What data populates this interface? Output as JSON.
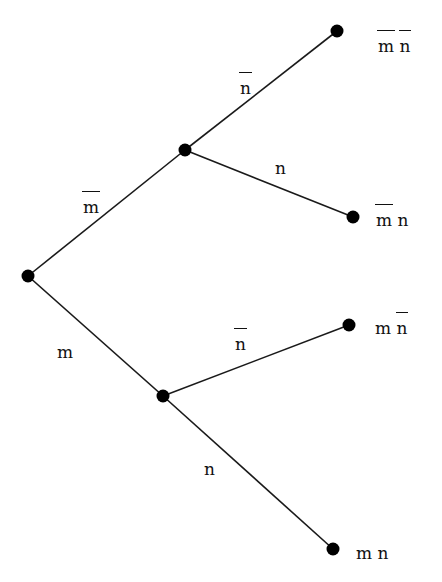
{
  "diagram": {
    "type": "probability-tree",
    "nodes": [
      {
        "id": "root",
        "x": 28,
        "y": 276
      },
      {
        "id": "not_m",
        "x": 185,
        "y": 150
      },
      {
        "id": "m",
        "x": 163,
        "y": 396
      },
      {
        "id": "not_m_not_n",
        "x": 337,
        "y": 31
      },
      {
        "id": "not_m_n",
        "x": 353,
        "y": 217
      },
      {
        "id": "m_not_n",
        "x": 349,
        "y": 325
      },
      {
        "id": "m_n",
        "x": 333,
        "y": 549
      }
    ],
    "edges": [
      {
        "from": "root",
        "to": "not_m",
        "label": "m",
        "barred": true
      },
      {
        "from": "root",
        "to": "m",
        "label": "m",
        "barred": false
      },
      {
        "from": "not_m",
        "to": "not_m_not_n",
        "label": "n",
        "barred": true
      },
      {
        "from": "not_m",
        "to": "not_m_n",
        "label": "n",
        "barred": false
      },
      {
        "from": "m",
        "to": "m_not_n",
        "label": "n",
        "barred": true
      },
      {
        "from": "m",
        "to": "m_n",
        "label": "n",
        "barred": false
      }
    ],
    "edge_labels": {
      "root_not_m": "m",
      "root_m": "m",
      "notm_notn": "n",
      "notm_n": "n",
      "m_notn": "n",
      "m_n": "n"
    },
    "leaf_labels": {
      "not_m_not_n": {
        "first": "m",
        "second": "n"
      },
      "not_m_n": {
        "first": "m",
        "second": "n"
      },
      "m_not_n": {
        "first": "m",
        "second": "n"
      },
      "m_n": {
        "first": "m",
        "second": "n"
      }
    },
    "colors": {
      "line": "#1a1a1a",
      "node": "#000000",
      "background": "#ffffff"
    }
  }
}
